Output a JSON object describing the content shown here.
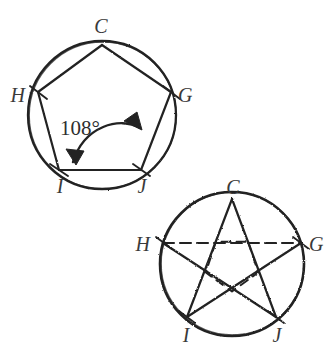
{
  "figure": {
    "title_visible": false,
    "background_color": "#ffffff",
    "ink_color": "#232323",
    "label_color": "#3a3a3a",
    "style": "hand-drawn pencil sketch geometry diagram"
  },
  "diagrams": [
    {
      "id": "pentagon-in-circle",
      "name": "regular-pentagon-inscribed-in-circle",
      "circle": {
        "cx": 102,
        "cy": 115,
        "r": 74
      },
      "vertices": [
        {
          "label": "C",
          "x": 102,
          "y": 45,
          "label_x": 101,
          "label_y": 33,
          "label_anchor": "middle"
        },
        {
          "label": "G",
          "x": 171,
          "y": 92,
          "label_x": 178,
          "label_y": 102,
          "label_anchor": "start"
        },
        {
          "label": "J",
          "x": 141,
          "y": 170,
          "label_x": 142,
          "label_y": 191,
          "label_anchor": "middle"
        },
        {
          "label": "I",
          "x": 59,
          "y": 170,
          "label_x": 60,
          "label_y": 191,
          "label_anchor": "middle"
        },
        {
          "label": "H",
          "x": 38,
          "y": 92,
          "label_x": 25,
          "label_y": 102,
          "label_anchor": "end"
        }
      ],
      "sides": [
        {
          "from": "C",
          "to": "G",
          "style": "solid"
        },
        {
          "from": "G",
          "to": "J",
          "style": "solid"
        },
        {
          "from": "J",
          "to": "I",
          "style": "solid"
        },
        {
          "from": "I",
          "to": "H",
          "style": "solid"
        },
        {
          "from": "H",
          "to": "C",
          "style": "solid"
        }
      ],
      "annotation": {
        "text": "108°",
        "value": 108,
        "unit": "degrees",
        "x": 60,
        "y": 135,
        "arrow": {
          "type": "double-headed-curved-arrow",
          "from_vertex": "I",
          "to_vertex": "J",
          "description": "curved arc with arrowheads at both ends spanning interior angle"
        }
      }
    },
    {
      "id": "pentagram-in-circle",
      "name": "pentagram-inscribed-in-circle",
      "circle": {
        "cx": 232,
        "cy": 264,
        "r": 72
      },
      "vertices": [
        {
          "label": "C",
          "x": 232,
          "y": 199,
          "label_x": 233,
          "label_y": 192,
          "label_anchor": "middle"
        },
        {
          "label": "G",
          "x": 301,
          "y": 243,
          "label_x": 309,
          "label_y": 251,
          "label_anchor": "start"
        },
        {
          "label": "J",
          "x": 276,
          "y": 317,
          "label_x": 277,
          "label_y": 340,
          "label_anchor": "middle"
        },
        {
          "label": "I",
          "x": 187,
          "y": 317,
          "label_x": 186,
          "label_y": 340,
          "label_anchor": "middle"
        },
        {
          "label": "H",
          "x": 163,
          "y": 243,
          "label_x": 150,
          "label_y": 251,
          "label_anchor": "end"
        }
      ],
      "chords": [
        {
          "from": "C",
          "to": "I",
          "style": "solid"
        },
        {
          "from": "C",
          "to": "J",
          "style": "solid"
        },
        {
          "from": "H",
          "to": "J",
          "style": "solid"
        },
        {
          "from": "G",
          "to": "I",
          "style": "solid"
        },
        {
          "from": "H",
          "to": "G",
          "style": "dashed"
        }
      ]
    }
  ]
}
